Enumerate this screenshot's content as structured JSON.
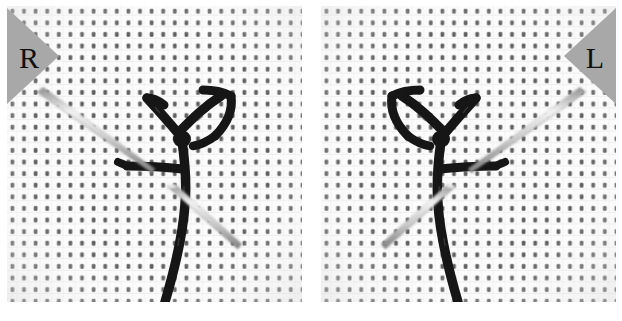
{
  "figure": {
    "type": "photographic-figure",
    "panel_count": 2,
    "layout": "side-by-side",
    "background_color": "#ffffff",
    "fabric_color": "#fbfbfb",
    "weave_dot_color": "#555555",
    "thread_color": "#141414",
    "needle_color": "#cfcfcf",
    "needle_edge_color": "#7a7a7a",
    "label_triangle_color": "#a8a8a8",
    "label_text_color": "#111111"
  },
  "panels": [
    {
      "id": "panel-left",
      "label": "R",
      "label_meaning": "right-handed",
      "label_corner": "top-left",
      "mirrored": false
    },
    {
      "id": "panel-right",
      "label": "L",
      "label_meaning": "left-handed",
      "label_corner": "top-right",
      "mirrored": true
    }
  ]
}
